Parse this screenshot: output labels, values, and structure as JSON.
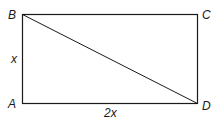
{
  "diagram": {
    "type": "rectangle-with-diagonal",
    "vertices": {
      "A": {
        "label": "A",
        "position": "bottom-left"
      },
      "B": {
        "label": "B",
        "position": "top-left"
      },
      "C": {
        "label": "C",
        "position": "top-right"
      },
      "D": {
        "label": "D",
        "position": "bottom-right"
      }
    },
    "diagonal": "BD",
    "side_labels": {
      "AB": "x",
      "AD": "2x"
    },
    "colors": {
      "stroke": "#1a1a1a",
      "background": "#ffffff"
    }
  }
}
